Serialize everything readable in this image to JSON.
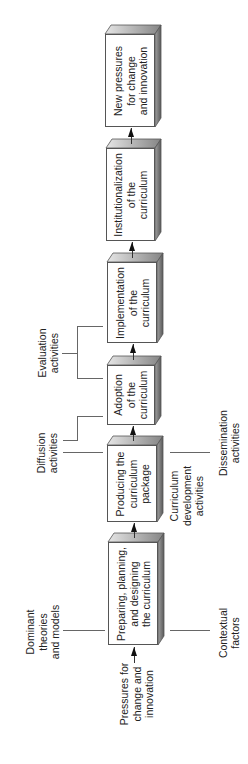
{
  "diagram": {
    "orientation": "rotated-90-ccw",
    "colors": {
      "box_face": "#ffffff",
      "box_border": "#555555",
      "bevel_top_light": "#e4e4e4",
      "bevel_top_dark": "#8a8a8a",
      "bevel_side_light": "#9a9a9a",
      "bevel_side_dark": "#5e5e5e",
      "line": "#666666",
      "arrow": "#111111"
    },
    "stages": [
      {
        "id": "preparing",
        "lines": [
          "Preparing, planning,",
          "and designing",
          "the curriculum"
        ]
      },
      {
        "id": "producing",
        "lines": [
          "Producing the",
          "curriculum",
          "package"
        ]
      },
      {
        "id": "adoption",
        "lines": [
          "Adoption",
          "of the",
          "curriculum"
        ]
      },
      {
        "id": "implementation",
        "lines": [
          "Implementation",
          "of the",
          "curriculum"
        ]
      },
      {
        "id": "institutionalization",
        "lines": [
          "Institutionalization",
          "of the",
          "curriculum"
        ]
      },
      {
        "id": "new-pressures",
        "lines": [
          "New pressures",
          "for change",
          "and innovation"
        ]
      }
    ],
    "annotations": {
      "dominant": [
        "Dominant",
        "theories",
        "and models"
      ],
      "contextual": [
        "Contextual",
        "factors"
      ],
      "pressures": [
        "Pressures for",
        "change and",
        "innovation"
      ],
      "curriculum_dev": [
        "Curriculum",
        "development",
        "activities"
      ],
      "dissemination": [
        "Dissemination",
        "activities"
      ],
      "diffusion": [
        "Diffusion",
        "activities"
      ],
      "evaluation": [
        "Evaluation",
        "activities"
      ]
    }
  }
}
